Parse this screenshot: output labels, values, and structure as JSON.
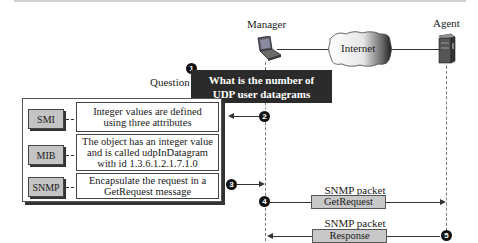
{
  "nodes": {
    "manager_label": "Manager",
    "agent_label": "Agent",
    "internet_label": "Internet"
  },
  "question": {
    "label": "Question",
    "line1": "What is the number of",
    "line2": "UDP user datagrams received?",
    "step": "1"
  },
  "layers": [
    {
      "tag": "SMI",
      "text_lines": [
        "Integer values are defined",
        "using three attributes"
      ]
    },
    {
      "tag": "MIB",
      "text_lines": [
        "The object has an integer value",
        "and is called udpInDatagram",
        "with id 1.3.6.1.2.1.7.1.0"
      ]
    },
    {
      "tag": "SNMP",
      "text_lines": [
        "Encapsulate the request in a",
        "GetRequest message"
      ]
    }
  ],
  "steps": {
    "s2": "2",
    "s3": "3",
    "s4": "4",
    "s5": "5"
  },
  "packets": [
    {
      "caption": "SNMP packet",
      "type": "GetRequest",
      "direction": "manager-to-agent"
    },
    {
      "caption": "SNMP packet",
      "type": "Response",
      "direction": "agent-to-manager"
    }
  ],
  "colors": {
    "question_bg": "#2b2b2b",
    "layer_tag_bg": "#c4c4c4",
    "packet_bg": "#c8c8c8"
  }
}
